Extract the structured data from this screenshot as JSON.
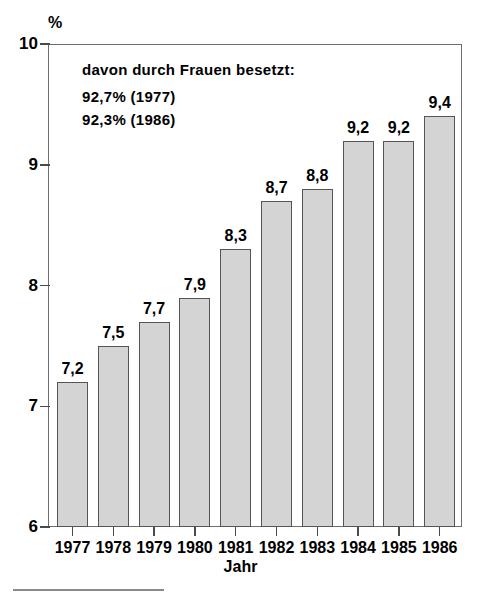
{
  "chart_data": {
    "type": "bar",
    "title": "",
    "subtitle": "",
    "unit_label": "%",
    "xlabel": "Jahr",
    "ylabel": "",
    "categories": [
      "1977",
      "1978",
      "1979",
      "1980",
      "1981",
      "1982",
      "1983",
      "1984",
      "1985",
      "1986"
    ],
    "values": [
      7.2,
      7.5,
      7.7,
      7.9,
      8.3,
      8.7,
      8.8,
      9.2,
      9.2,
      9.4
    ],
    "value_labels": [
      "7,2",
      "7,5",
      "7,7",
      "7,9",
      "8,3",
      "8,7",
      "8,8",
      "9,2",
      "9,2",
      "9,4"
    ],
    "ylim": [
      6,
      10
    ],
    "ytick_values": [
      10,
      9,
      8,
      7,
      6
    ],
    "ytick_labels": [
      "10",
      "9",
      "8",
      "7",
      "6"
    ],
    "grid": false,
    "legend": null,
    "series": [
      {
        "name": "",
        "values": [
          7.2,
          7.5,
          7.7,
          7.9,
          8.3,
          8.7,
          8.8,
          9.2,
          9.2,
          9.4
        ]
      }
    ],
    "annotations": [
      {
        "id": "heading",
        "text": "davon durch Frauen besetzt:"
      },
      {
        "id": "share-1977",
        "text": "92,7% (1977)"
      },
      {
        "id": "share-1986",
        "text": "92,3% (1986)"
      }
    ],
    "colors": {
      "bar_fill": "#d4d4d4",
      "bar_border": "#555555",
      "axis": "#6d6d6d",
      "text": "#000000",
      "rule": "#8a8a8a"
    }
  }
}
